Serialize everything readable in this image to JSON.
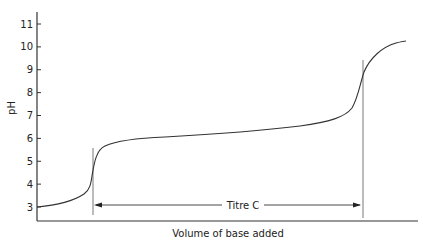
{
  "chart_data": {
    "type": "line",
    "title": "",
    "xlabel": "Volume of base added",
    "ylabel": "pH",
    "ylim": [
      2.4,
      11.6
    ],
    "yticks": [
      3,
      4,
      5,
      6,
      7,
      8,
      9,
      10,
      11
    ],
    "xticks": [],
    "grid": false,
    "legend": null,
    "series": [
      {
        "name": "Titration curve",
        "x": [
          0,
          0.05,
          0.1,
          0.13,
          0.15,
          0.16,
          0.17,
          0.18,
          0.2,
          0.24,
          0.3,
          0.4,
          0.5,
          0.6,
          0.7,
          0.76,
          0.8,
          0.83,
          0.85,
          0.86,
          0.87,
          0.89,
          0.91,
          0.94,
          0.98
        ],
        "y": [
          3.0,
          3.1,
          3.3,
          3.6,
          4.1,
          4.6,
          5.1,
          5.5,
          5.8,
          5.95,
          6.05,
          6.15,
          6.3,
          6.45,
          6.65,
          6.8,
          7.0,
          7.3,
          7.8,
          8.4,
          9.0,
          9.6,
          10.0,
          10.3,
          10.4
        ]
      }
    ],
    "annotations": [
      {
        "type": "vertical-line",
        "x": 0.15,
        "label": "first equivalence point"
      },
      {
        "type": "vertical-line",
        "x": 0.87,
        "label": "second equivalence point"
      },
      {
        "type": "double-arrow",
        "from": 0.15,
        "to": 0.87,
        "y": 2.9,
        "text": "Titre C"
      }
    ]
  },
  "labels": {
    "y_axis": "pH",
    "x_axis": "Volume of base added",
    "titre": "Titre C",
    "ticks": [
      "3",
      "4",
      "5",
      "6",
      "7",
      "8",
      "9",
      "10",
      "11"
    ]
  }
}
